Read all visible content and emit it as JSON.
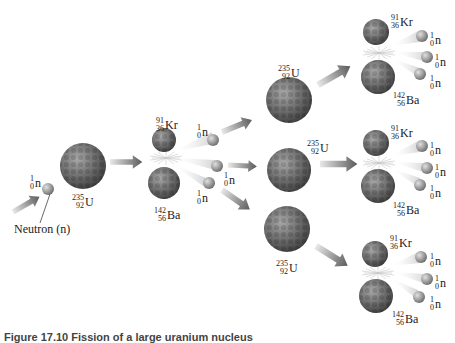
{
  "diagram": {
    "type": "nuclear-fission-chain-reaction",
    "incoming_neutron_label": "Neutron (n)",
    "colors": {
      "nucleus": "#6e6e6e",
      "nucleus_dark": "#3e3e3e",
      "nucleus_light": "#a8a8a8",
      "neutron": "#9a9a9a",
      "arrow": "#7a7a7a",
      "background": "#ffffff"
    },
    "isotopes": {
      "neutron": {
        "mass": "1",
        "atomic": "0",
        "symbol": "n"
      },
      "uranium": {
        "mass": "235",
        "atomic": "92",
        "symbol": "U"
      },
      "krypton": {
        "mass": "91",
        "atomic": "36",
        "symbol": "Kr"
      },
      "barium": {
        "mass": "142",
        "atomic": "56",
        "symbol": "Ba"
      }
    },
    "stages": [
      {
        "name": "initial",
        "items": [
          "neutron",
          "uranium"
        ]
      },
      {
        "name": "first-fission",
        "items": [
          "krypton",
          "barium",
          "neutron",
          "neutron",
          "neutron"
        ]
      },
      {
        "name": "second-generation-uranium",
        "items": [
          "uranium",
          "uranium",
          "uranium"
        ]
      },
      {
        "name": "second-fission",
        "items": [
          [
            "krypton",
            "barium",
            "neutron",
            "neutron",
            "neutron"
          ],
          [
            "krypton",
            "barium",
            "neutron",
            "neutron",
            "neutron"
          ],
          [
            "krypton",
            "barium",
            "neutron",
            "neutron",
            "neutron"
          ]
        ]
      }
    ]
  },
  "caption": {
    "text": "Figure 17.10   Fission of a large uranium nucleus"
  }
}
